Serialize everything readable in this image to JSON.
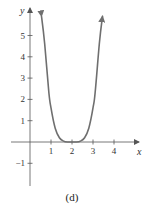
{
  "chart_data": {
    "type": "line",
    "title": "",
    "caption": "(d)",
    "xlabel": "x",
    "ylabel": "y",
    "xlim": [
      -0.9,
      5.3
    ],
    "ylim": [
      -2.0,
      6.1
    ],
    "x_ticks": [
      1,
      2,
      3,
      4
    ],
    "x_tick_labels": [
      "1",
      "2",
      "3",
      "4"
    ],
    "y_ticks": [
      -1,
      1,
      2,
      3,
      4,
      5
    ],
    "y_tick_labels": [
      "-1",
      "1",
      "2",
      "3",
      "4",
      "5"
    ],
    "grid": false,
    "legend": null,
    "series": [
      {
        "name": "curve",
        "color": "#6f6f6f",
        "description": "quartic-like curve with flat minimum at y=0 around x=2, rising to arrows at both ends",
        "x": [
          0.55,
          0.7,
          0.9,
          1.0,
          1.2,
          1.4,
          1.6,
          1.8,
          2.0,
          2.2,
          2.4,
          2.6,
          2.8,
          3.0,
          3.1,
          3.3,
          3.45
        ],
        "y": [
          5.9,
          4.6,
          2.3,
          1.6,
          0.65,
          0.2,
          0.04,
          0.0,
          0.0,
          0.0,
          0.04,
          0.2,
          0.65,
          1.6,
          2.3,
          4.6,
          5.9
        ],
        "end_arrows": true
      }
    ]
  }
}
